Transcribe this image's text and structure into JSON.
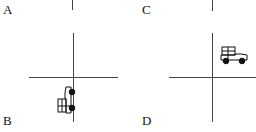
{
  "panels": [
    {
      "label": "A",
      "contents": "axis-stub-only"
    },
    {
      "label": "B",
      "contents": "car-rotated-facing-up-in-third-quadrant"
    },
    {
      "label": "C",
      "contents": "axis-stub-only"
    },
    {
      "label": "D",
      "contents": "car-facing-right-in-first-quadrant"
    }
  ],
  "icons": {
    "car_b": "car-icon",
    "car_d": "car-icon"
  },
  "colors": {
    "line": "#444444",
    "ink": "#111111",
    "background": "#ffffff"
  }
}
